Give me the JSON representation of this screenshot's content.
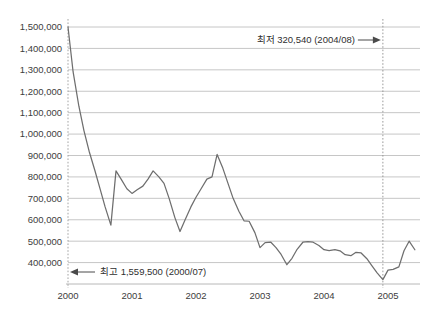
{
  "chart_data": {
    "type": "line",
    "title": "",
    "subtitle": "",
    "xlabel": "",
    "ylabel": "",
    "grid": true,
    "legend": "none",
    "xlim": [
      2000.0,
      2005.5
    ],
    "ylim": [
      300000,
      1500000
    ],
    "y_ticks": [
      400000,
      500000,
      600000,
      700000,
      800000,
      900000,
      1000000,
      1100000,
      1200000,
      1300000,
      1400000,
      1500000
    ],
    "y_tick_labels": [
      "400,000",
      "500,000",
      "600,000",
      "700,000",
      "800,000",
      "900,000",
      "1,000,000",
      "1,100,000",
      "1,200,000",
      "1,300,000",
      "1,400,000",
      "1,500,000"
    ],
    "x_ticks": [
      2000,
      2001,
      2002,
      2003,
      2004,
      2005
    ],
    "x_tick_labels": [
      "2000",
      "2001",
      "2002",
      "2003",
      "2004",
      "2005"
    ],
    "series": [
      {
        "name": "series-1",
        "color": "#6e6e6e",
        "x": [
          2000.0,
          2000.08,
          2000.17,
          2000.25,
          2000.33,
          2000.42,
          2000.5,
          2000.58,
          2000.67,
          2000.75,
          2000.83,
          2000.92,
          2001.0,
          2001.08,
          2001.17,
          2001.25,
          2001.33,
          2001.42,
          2001.5,
          2001.58,
          2001.67,
          2001.75,
          2001.83,
          2001.92,
          2002.0,
          2002.08,
          2002.17,
          2002.25,
          2002.33,
          2002.42,
          2002.5,
          2002.58,
          2002.67,
          2002.75,
          2002.83,
          2002.92,
          2003.0,
          2003.08,
          2003.17,
          2003.25,
          2003.33,
          2003.42,
          2003.5,
          2003.58,
          2003.67,
          2003.75,
          2003.83,
          2003.92,
          2004.0,
          2004.08,
          2004.17,
          2004.25,
          2004.33,
          2004.42,
          2004.5,
          2004.58,
          2004.67,
          2004.75,
          2004.83,
          2004.92,
          2005.0,
          2005.08,
          2005.17,
          2005.25,
          2005.33,
          2005.42
        ],
        "values": [
          1500000,
          1290000,
          1130000,
          1015000,
          920000,
          830000,
          745000,
          660000,
          575000,
          828000,
          790000,
          745000,
          723000,
          740000,
          757000,
          790000,
          828000,
          800000,
          770000,
          700000,
          610000,
          545000,
          600000,
          660000,
          705000,
          745000,
          790000,
          800000,
          905000,
          840000,
          770000,
          700000,
          640000,
          595000,
          593000,
          540000,
          470000,
          493000,
          495000,
          470000,
          438000,
          390000,
          420000,
          462000,
          495000,
          498000,
          495000,
          480000,
          460000,
          456000,
          460000,
          455000,
          437000,
          432000,
          448000,
          445000,
          418000,
          385000,
          352000,
          320540,
          365000,
          368000,
          380000,
          455000,
          500000,
          460000
        ]
      }
    ],
    "annotations": [
      {
        "id": "min-annotation",
        "text": "최저 320,540 (2004/08)",
        "value": 320540,
        "date": "2004/08",
        "arrow": "right"
      },
      {
        "id": "max-annotation",
        "text": "최고 1,559,500 (2000/07)",
        "value": 1559500,
        "date": "2000/07",
        "arrow": "left"
      }
    ],
    "marker_lines": [
      {
        "id": "min-marker",
        "x": 2004.92,
        "style": "dotted"
      },
      {
        "id": "start-marker",
        "x": 2000.0,
        "style": "dotted"
      }
    ],
    "colors": {
      "line": "#6e6e6e",
      "grid": "#bfbfbf",
      "text": "#3d3d3d",
      "background": "#ffffff"
    }
  }
}
